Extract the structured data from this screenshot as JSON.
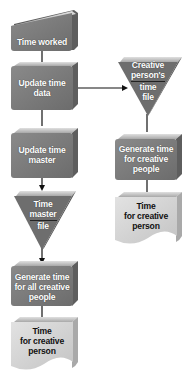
{
  "diagram": {
    "type": "flowchart",
    "colors": {
      "process_fill": "#7d7d7d",
      "process_top": "#b8b8b8",
      "process_side": "#5e5e5e",
      "file_fill": "#6e6e6e",
      "output_fill": "#d9d9d9",
      "connector": "#111111"
    },
    "nodes": {
      "time_worked": {
        "shape": "manual-input",
        "label": "Time worked"
      },
      "update_time_data": {
        "shape": "process",
        "label": "Update time data",
        "line1": "Update time",
        "line2": "data"
      },
      "update_time_master": {
        "shape": "process",
        "label": "Update time master",
        "line1": "Update time",
        "line2": "master"
      },
      "time_master_file": {
        "shape": "file-triangle",
        "label": "Time master file",
        "line1": "Time",
        "line2": "master",
        "line3": "file"
      },
      "generate_all": {
        "shape": "process",
        "label": "Generate time for all creative people",
        "line1": "Generate time",
        "line2": "for all creative",
        "line3": "people"
      },
      "output_left": {
        "shape": "document",
        "label": "Time for creative person",
        "line1": "Time",
        "line2": "for creative",
        "line3": "person"
      },
      "creative_file": {
        "shape": "file-triangle",
        "label": "Creative person's time file",
        "line1": "Creative",
        "line2": "person's",
        "line3": "time",
        "line4": "file"
      },
      "generate_creative": {
        "shape": "process",
        "label": "Generate time for creative people",
        "line1": "Generate time",
        "line2": "for creative",
        "line3": "people"
      },
      "output_right": {
        "shape": "document",
        "label": "Time for creative person",
        "line1": "Time",
        "line2": "for creative",
        "line3": "person"
      }
    },
    "edges": [
      {
        "from": "time_worked",
        "to": "update_time_data"
      },
      {
        "from": "update_time_data",
        "to": "update_time_master"
      },
      {
        "from": "update_time_data",
        "to": "creative_file",
        "arrow": true
      },
      {
        "from": "update_time_master",
        "to": "time_master_file",
        "arrow": true
      },
      {
        "from": "time_master_file",
        "to": "generate_all",
        "arrow": true
      },
      {
        "from": "generate_all",
        "to": "output_left"
      },
      {
        "from": "creative_file",
        "to": "generate_creative"
      },
      {
        "from": "generate_creative",
        "to": "output_right"
      }
    ]
  }
}
